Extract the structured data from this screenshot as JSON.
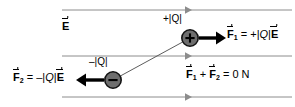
{
  "figure": {
    "colors": {
      "field_line": "#8c8c8c",
      "charge_fill": "#6e6e6e",
      "charge_stroke": "#1a1a1a",
      "force_arrow": "#000000",
      "text": "#000000",
      "background": "#ffffff"
    }
  },
  "labels": {
    "field_symbol": "E",
    "positive_charge": "+|Q|",
    "positive_charge_sign": "+",
    "negative_charge": "–|Q|",
    "negative_charge_sign": "–",
    "force1": {
      "symbol": "F",
      "subscript": "1",
      "equals": "=",
      "value_prefix": "+|",
      "value_charge": "Q",
      "value_mid": "|",
      "value_field": "E"
    },
    "force2": {
      "symbol": "F",
      "subscript": "2",
      "equals": "=",
      "value_prefix": "–|",
      "value_charge": "Q",
      "value_mid": "|",
      "value_field": "E"
    },
    "sum": {
      "term1_symbol": "F",
      "term1_subscript": "1",
      "plus": "+",
      "term2_symbol": "F",
      "term2_subscript": "2",
      "equals": "=",
      "result": "0 N"
    }
  },
  "field_lines": [
    {
      "y": 10,
      "x1": 62,
      "x2": 292,
      "arrow_x": 188
    },
    {
      "y": 56,
      "x1": 62,
      "x2": 292,
      "arrow_x": 188
    },
    {
      "y": 97,
      "x1": 62,
      "x2": 292,
      "arrow_x": 188
    }
  ],
  "charges": [
    {
      "name": "positive-charge",
      "cx": 190,
      "cy": 38,
      "r": 8,
      "sign": "+"
    },
    {
      "name": "negative-charge",
      "cx": 113,
      "cy": 80,
      "r": 8,
      "sign": "–"
    }
  ],
  "connector": {
    "x1": 113,
    "y1": 80,
    "x2": 190,
    "y2": 38
  },
  "force_arrows": [
    {
      "name": "force1-arrow",
      "x1": 200,
      "y1": 38,
      "x2": 224,
      "y2": 38,
      "direction": "right"
    },
    {
      "name": "force2-arrow",
      "x1": 103,
      "y1": 80,
      "x2": 74,
      "y2": 80,
      "direction": "left"
    }
  ]
}
